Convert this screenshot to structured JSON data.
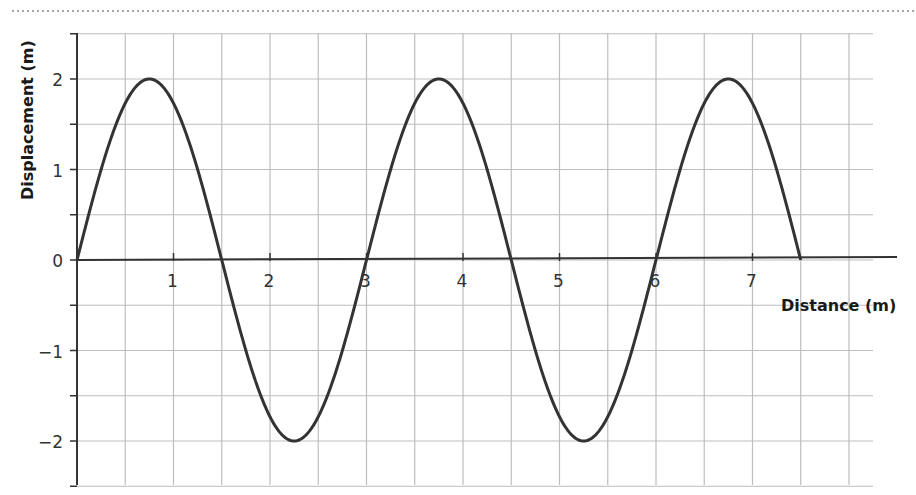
{
  "chart_data": {
    "type": "line",
    "title": "",
    "xlabel": "Distance (m)",
    "ylabel": "Displacement (m)",
    "xlim": [
      0,
      8.25
    ],
    "ylim": [
      -2.5,
      2.5
    ],
    "x_ticks": [
      1,
      2,
      3,
      4,
      5,
      6,
      7
    ],
    "x_tick_labels": [
      "1",
      "2",
      "3",
      "4",
      "5",
      "6",
      "7"
    ],
    "y_ticks": [
      2,
      1,
      0,
      -1,
      -2
    ],
    "y_tick_labels": [
      "2",
      "1",
      "0",
      "−1",
      "−2"
    ],
    "grid": true,
    "grid_step_x": 0.5,
    "grid_step_y": 0.5,
    "legend": null,
    "series": [
      {
        "name": "wave",
        "description": "sine wave, amplitude 2 m, wavelength 3 m, from x=0 to x=7.5",
        "amplitude": 2,
        "wavelength": 3,
        "x": [
          0,
          0.75,
          1.5,
          2.25,
          3,
          3.75,
          4.5,
          5.25,
          6,
          6.75,
          7.5
        ],
        "y": [
          0,
          2,
          0,
          -2,
          0,
          2,
          0,
          -2,
          0,
          2,
          0
        ]
      }
    ],
    "colors": {
      "curve": "#333333",
      "grid": "#bdbdbd",
      "axis": "#333333"
    }
  }
}
